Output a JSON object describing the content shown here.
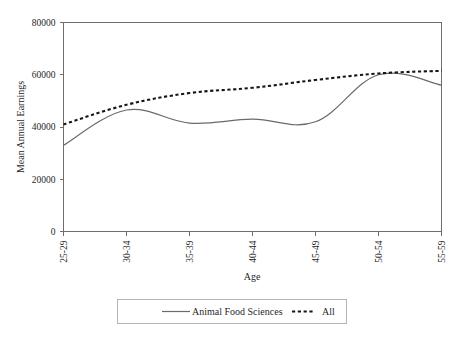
{
  "chart_data": {
    "type": "line",
    "title": "",
    "xlabel": "Age",
    "ylabel": "Mean Annual Earnings",
    "categories": [
      "25-29",
      "30-34",
      "35-39",
      "40-44",
      "45-49",
      "50-54",
      "55-59"
    ],
    "ylim": [
      0,
      80000
    ],
    "yticks": [
      0,
      20000,
      40000,
      60000,
      80000
    ],
    "ytick_labels": [
      "0",
      "20000",
      "40000",
      "60000",
      "80000"
    ],
    "grid": false,
    "legend_position": "bottom",
    "series": [
      {
        "name": "Animal Food Sciences",
        "style": "solid",
        "color": "#6a6a6a",
        "values": [
          33000,
          46500,
          41500,
          43000,
          42000,
          60000,
          56000
        ]
      },
      {
        "name": "All",
        "style": "dashed",
        "color": "#171717",
        "values": [
          41000,
          48500,
          53000,
          55000,
          58000,
          60500,
          61500
        ]
      }
    ]
  },
  "axis": {
    "x_label": "Age",
    "y_label": "Mean Annual Earnings"
  },
  "legend": {
    "items": [
      {
        "label": "Animal Food Sciences",
        "style": "solid"
      },
      {
        "label": "All",
        "style": "dashed"
      }
    ]
  }
}
